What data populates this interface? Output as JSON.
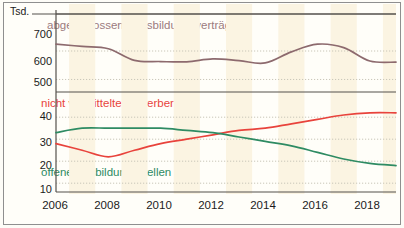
{
  "chart_data": {
    "type": "line",
    "title": "",
    "unit_label": "Tsd.",
    "xlabel": "",
    "grid": true,
    "legend_position": "inline-annotations",
    "x": [
      2006,
      2007,
      2008,
      2009,
      2010,
      2011,
      2012,
      2013,
      2014,
      2015,
      2016,
      2017,
      2018,
      2019
    ],
    "xtick_labels": [
      "2006",
      "2008",
      "2010",
      "2012",
      "2014",
      "2016",
      "2018"
    ],
    "xtick_values": [
      2006,
      2008,
      2010,
      2012,
      2014,
      2016,
      2018
    ],
    "panels": [
      {
        "name": "upper",
        "ylabel": "",
        "ylim": [
          470,
          730
        ],
        "ytick_labels": [
          "700",
          "600",
          "500"
        ],
        "ytick_values": [
          700,
          600,
          500
        ],
        "series": [
          {
            "name": "abgeschlossene Ausbildungsverträge",
            "color": "#8d6a6e",
            "values": [
              624,
              616,
              608,
              567,
              563,
              562,
              572,
              566,
              558,
              597,
              624,
              612,
              565,
              561
            ]
          }
        ]
      },
      {
        "name": "lower",
        "ylabel": "",
        "ylim": [
          6,
          46
        ],
        "ytick_labels": [
          "40",
          "30",
          "20",
          "10"
        ],
        "ytick_values": [
          40,
          30,
          20,
          10
        ],
        "series": [
          {
            "name": "nicht vermittelte Bewerber",
            "color": "#e8433c",
            "values": [
              28,
              25,
              22,
              25,
              28,
              30,
              32,
              34,
              35,
              37,
              39,
              41,
              42,
              42
            ]
          },
          {
            "name": "offene Ausbildungsstellen",
            "color": "#2e8b63",
            "values": [
              33,
              35,
              35,
              35,
              35,
              34,
              33,
              31,
              29,
              27,
              24,
              21,
              19,
              18
            ]
          }
        ]
      }
    ],
    "annotations": [
      {
        "text": "abgeschlossene Ausbildungsverträge",
        "color": "#9c7b7e",
        "panel": "upper"
      },
      {
        "text": "nicht vermittelte Bewerber",
        "color": "#e8433c",
        "panel": "lower"
      },
      {
        "text": "offene Ausbildungsstellen",
        "color": "#2e8b63",
        "panel": "lower"
      }
    ],
    "colors": {
      "background": "#fffef9",
      "band": "#fbf4e2",
      "frame": "#8f8f8f",
      "gridline": "#c9c6b8",
      "brown": "#8d6a6e",
      "red": "#e8433c",
      "green": "#2e8b63"
    }
  }
}
